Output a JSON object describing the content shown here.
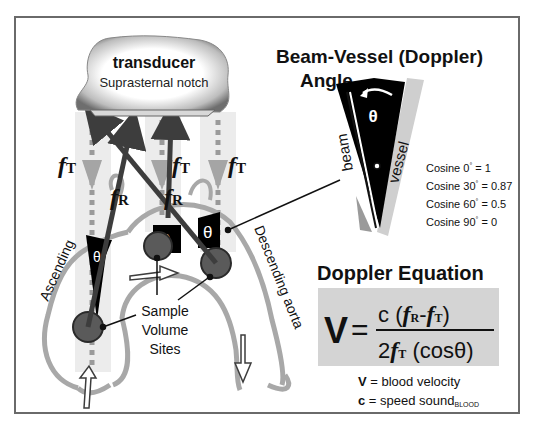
{
  "transducer": {
    "title": "transducer",
    "subtitle": "Suprasternal notch"
  },
  "beam_labels": {
    "f_symbol": "f",
    "t_sub": "T",
    "r_sub": "R"
  },
  "aorta": {
    "ascending_label": "Ascending",
    "descending_label": "Descending aorta",
    "sample_label_line1": "Sample",
    "sample_label_line2": "Volume",
    "sample_label_line3": "Sites",
    "theta": "θ"
  },
  "angle_panel": {
    "title_line1": "Beam-Vessel (Doppler)",
    "title_line2": "Angle",
    "beam_label": "beam",
    "vessel_label": "vessel",
    "theta": "θ"
  },
  "cosine_table": [
    {
      "label": "Cosine",
      "angle": "0",
      "value": "= 1"
    },
    {
      "label": "Cosine",
      "angle": "30",
      "value": "= 0.87"
    },
    {
      "label": "Cosine",
      "angle": "60",
      "value": "= 0.5"
    },
    {
      "label": "Cosine",
      "angle": "90",
      "value": "= 0"
    }
  ],
  "equation": {
    "title": "Doppler Equation",
    "lhs": "V",
    "equals": "=",
    "numerator_c": "c",
    "numerator_open": "(",
    "minus": "-",
    "numerator_close": ")",
    "denominator_two": "2",
    "denominator_cos": "(cosθ)",
    "legend_v_symbol": "V",
    "legend_v_text": " = blood velocity",
    "legend_c_symbol": "c",
    "legend_c_text": " = speed sound",
    "legend_c_sub": "BLOOD"
  },
  "colors": {
    "dark_arrow": "#3d3d3d",
    "beam_dashed": "#9a9a9a",
    "beam_band": "#ececec",
    "vessel_outline": "#a8a8a8",
    "sample_circle": "#5a5a5a",
    "equation_bg": "#d4d4d4"
  }
}
